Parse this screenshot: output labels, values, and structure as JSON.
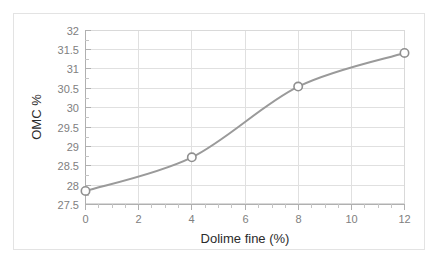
{
  "chart_data": {
    "type": "line",
    "title": "",
    "xlabel": "Dolime fine (%)",
    "ylabel": "OMC %",
    "x": [
      0,
      4,
      8,
      12
    ],
    "values": [
      27.85,
      28.72,
      30.55,
      31.42
    ],
    "series": [
      {
        "name": "OMC %",
        "x": [
          0,
          4,
          8,
          12
        ],
        "values": [
          27.85,
          28.72,
          30.55,
          31.42
        ]
      }
    ],
    "xlim": [
      0,
      12
    ],
    "ylim": [
      27.5,
      32
    ],
    "xticks": [
      0,
      2,
      4,
      6,
      8,
      10,
      12
    ],
    "xtick_labels": [
      "0",
      "2",
      "4",
      "6",
      "8",
      "10",
      "12"
    ],
    "yticks": [
      27.5,
      28,
      28.5,
      29,
      29.5,
      30,
      30.5,
      31,
      31.5,
      32
    ],
    "ytick_labels": [
      "27.5",
      "28",
      "28.5",
      "29",
      "29.5",
      "30",
      "30.5",
      "31",
      "31.5",
      "32"
    ],
    "grid": true,
    "grid_axis": "both",
    "legend": false,
    "legend_position": "none",
    "marker": "open-circle",
    "line_color": "#9a9a9a",
    "marker_fill": "#ffffff",
    "marker_edge_color": "#8f8f8f",
    "grid_color": "#e0e0e0",
    "axis_color": "#b0b0b0",
    "tick_label_color": "#808080",
    "axis_title_color": "#2b2b2b",
    "background_color": "#ffffff",
    "smoothing": "spline"
  }
}
